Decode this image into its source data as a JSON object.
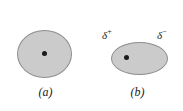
{
  "figure": {
    "background_color": "#ffffff",
    "cloud_fill_color": "#cbcbcb",
    "cloud_stroke_color": "#8e8e8e",
    "nucleus_color": "#1a1a1a",
    "text_color": "#1a1a1a",
    "panels": [
      {
        "id": "a",
        "caption": "(a)",
        "shape": "circle",
        "labels": []
      },
      {
        "id": "b",
        "caption": "(b)",
        "shape": "ellipse",
        "labels": [
          {
            "symbol": "δ",
            "sign": "+",
            "text": "δ+"
          },
          {
            "symbol": "δ",
            "sign": "−",
            "text": "δ−"
          }
        ]
      }
    ]
  },
  "panel_a": {
    "caption": "(a)"
  },
  "panel_b": {
    "caption": "(b)",
    "delta_plus": {
      "symbol": "δ",
      "sign": "+"
    },
    "delta_minus": {
      "symbol": "δ",
      "sign": "−"
    }
  }
}
